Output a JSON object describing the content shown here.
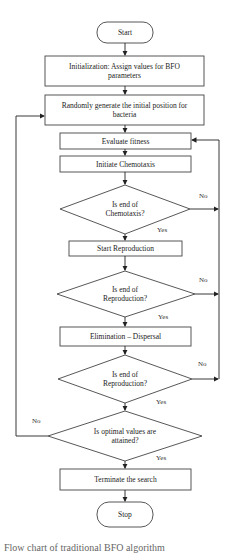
{
  "flowchart": {
    "start": "Start",
    "init": "Initialization: Assign values for BFO parameters",
    "random": "Randomly generate the initial position for bacteria",
    "evaluate": "Evaluate fitness",
    "chemotaxis": "Initiate Chemotaxis",
    "decision1": "Is end of Chemotaxis?",
    "reproduction": "Start Reproduction",
    "decision2": "Is end of Reproduction?",
    "elimination": "Elimination – Dispersal",
    "decision3": "Is end of Reproduction?",
    "decision4": "Is optimal values are attained?",
    "terminate": "Terminate the search",
    "stop": "Stop",
    "yes": "Yes",
    "no": "No"
  },
  "caption": "Flow chart of traditional BFO algorithm"
}
